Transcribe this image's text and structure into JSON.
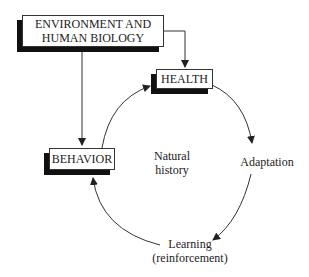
{
  "diagram": {
    "nodes": {
      "environment": {
        "line1": "ENVIRONMENT AND",
        "line2": "HUMAN BIOLOGY"
      },
      "health": {
        "label": "HEALTH"
      },
      "behavior": {
        "label": "BEHAVIOR"
      },
      "natural_history": {
        "line1": "Natural",
        "line2": "history"
      },
      "adaptation": {
        "label": "Adaptation"
      },
      "learning": {
        "line1": "Learning",
        "line2": "(reinforcement)"
      }
    },
    "edges": [
      {
        "from": "ENVIRONMENT AND HUMAN BIOLOGY",
        "to": "HEALTH"
      },
      {
        "from": "ENVIRONMENT AND HUMAN BIOLOGY",
        "to": "BEHAVIOR"
      },
      {
        "from": "HEALTH",
        "to": "Adaptation"
      },
      {
        "from": "Adaptation",
        "to": "Learning (reinforcement)"
      },
      {
        "from": "Learning (reinforcement)",
        "to": "BEHAVIOR"
      },
      {
        "from": "BEHAVIOR",
        "to": "HEALTH"
      }
    ]
  }
}
